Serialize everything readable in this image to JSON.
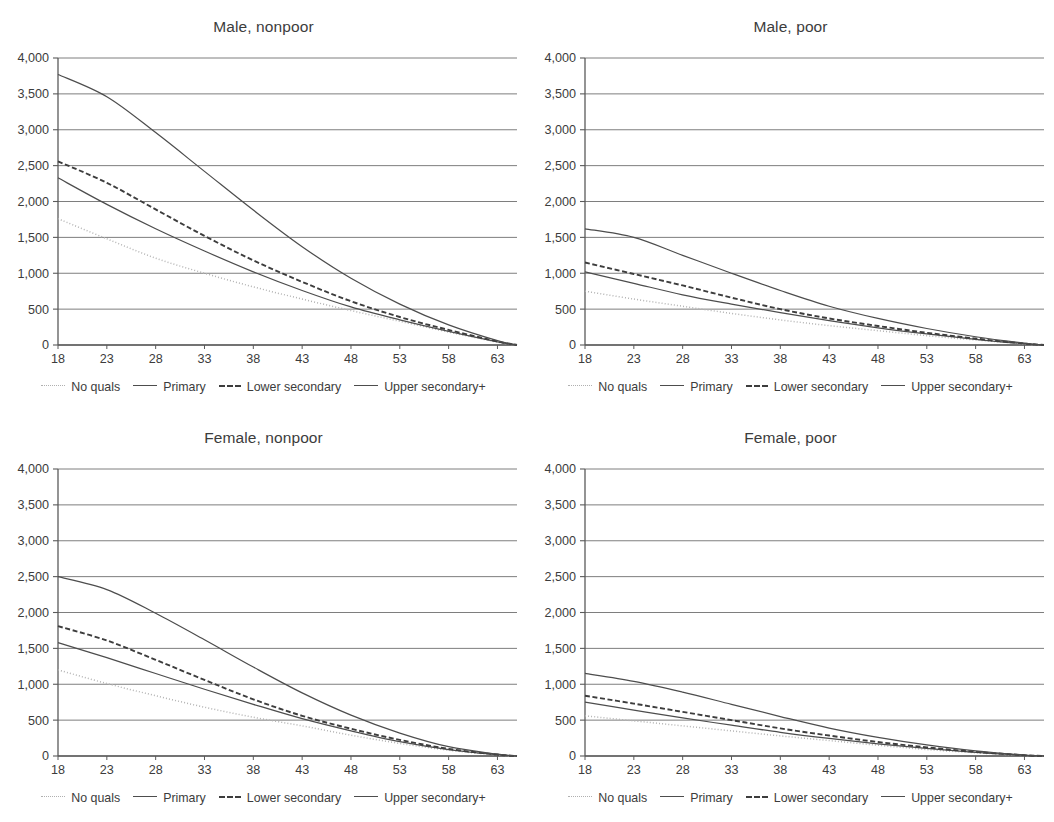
{
  "figure": {
    "panel_count": 4,
    "axis_color": "#5a5a5a",
    "grid_color": "#6b6b6b",
    "text_color": "#3c3c3c"
  },
  "legend": {
    "items": [
      {
        "label": "No quals",
        "style": "dotted",
        "color": "#b0b0b0",
        "icon": "line-dotted-icon"
      },
      {
        "label": "Primary",
        "style": "solid",
        "color": "#4d4d4d",
        "icon": "line-solid-icon"
      },
      {
        "label": "Lower secondary",
        "style": "dashed",
        "color": "#3d3d3d",
        "icon": "line-dashed-icon"
      },
      {
        "label": "Upper secondary+",
        "style": "solid",
        "color": "#4d4d4d",
        "icon": "line-solid-icon"
      }
    ]
  },
  "chart_data": [
    {
      "type": "line",
      "title": "Male, nonpoor",
      "xlabel": "",
      "ylabel": "",
      "xlim": [
        18,
        65
      ],
      "ylim": [
        0,
        4000
      ],
      "xticks": [
        18,
        23,
        28,
        33,
        38,
        43,
        48,
        53,
        58,
        63
      ],
      "yticks": [
        0,
        500,
        1000,
        1500,
        2000,
        2500,
        3000,
        3500,
        4000
      ],
      "ytick_labels": [
        "0",
        "500",
        "1,000",
        "1,500",
        "2,000",
        "2,500",
        "3,000",
        "3,500",
        "4,000"
      ],
      "grid": "horizontal",
      "legend_position": "below",
      "x": [
        18,
        23,
        28,
        33,
        38,
        43,
        48,
        53,
        58,
        63,
        65
      ],
      "series": [
        {
          "name": "No quals",
          "style": "dotted",
          "values": [
            1760,
            1480,
            1210,
            1000,
            810,
            640,
            480,
            330,
            180,
            40,
            0
          ]
        },
        {
          "name": "Primary",
          "style": "solid",
          "values": [
            2330,
            1960,
            1620,
            1310,
            1020,
            760,
            530,
            350,
            190,
            45,
            0
          ]
        },
        {
          "name": "Lower secondary",
          "style": "dashed",
          "values": [
            2560,
            2260,
            1890,
            1520,
            1180,
            880,
            610,
            390,
            210,
            50,
            0
          ]
        },
        {
          "name": "Upper secondary+",
          "style": "solid",
          "values": [
            3770,
            3460,
            2960,
            2420,
            1880,
            1370,
            930,
            570,
            280,
            60,
            0
          ]
        }
      ]
    },
    {
      "type": "line",
      "title": "Male, poor",
      "xlabel": "",
      "ylabel": "",
      "xlim": [
        18,
        65
      ],
      "ylim": [
        0,
        4000
      ],
      "xticks": [
        18,
        23,
        28,
        33,
        38,
        43,
        48,
        53,
        58,
        63
      ],
      "yticks": [
        0,
        500,
        1000,
        1500,
        2000,
        2500,
        3000,
        3500,
        4000
      ],
      "ytick_labels": [
        "0",
        "500",
        "1,000",
        "1,500",
        "2,000",
        "2,500",
        "3,000",
        "3,500",
        "4,000"
      ],
      "grid": "horizontal",
      "legend_position": "below",
      "x": [
        18,
        23,
        28,
        33,
        38,
        43,
        48,
        53,
        58,
        63,
        65
      ],
      "series": [
        {
          "name": "No quals",
          "style": "dotted",
          "values": [
            750,
            640,
            540,
            440,
            350,
            270,
            200,
            130,
            70,
            15,
            0
          ]
        },
        {
          "name": "Primary",
          "style": "solid",
          "values": [
            1020,
            860,
            700,
            570,
            450,
            340,
            240,
            155,
            80,
            18,
            0
          ]
        },
        {
          "name": "Lower secondary",
          "style": "dashed",
          "values": [
            1150,
            990,
            830,
            660,
            500,
            370,
            265,
            170,
            90,
            20,
            0
          ]
        },
        {
          "name": "Upper secondary+",
          "style": "solid",
          "values": [
            1620,
            1500,
            1250,
            1000,
            760,
            540,
            370,
            230,
            115,
            25,
            0
          ]
        }
      ]
    },
    {
      "type": "line",
      "title": "Female, nonpoor",
      "xlabel": "",
      "ylabel": "",
      "xlim": [
        18,
        65
      ],
      "ylim": [
        0,
        4000
      ],
      "xticks": [
        18,
        23,
        28,
        33,
        38,
        43,
        48,
        53,
        58,
        63
      ],
      "yticks": [
        0,
        500,
        1000,
        1500,
        2000,
        2500,
        3000,
        3500,
        4000
      ],
      "ytick_labels": [
        "0",
        "500",
        "1,000",
        "1,500",
        "2,000",
        "2,500",
        "3,000",
        "3,500",
        "4,000"
      ],
      "grid": "horizontal",
      "legend_position": "below",
      "x": [
        18,
        23,
        28,
        33,
        38,
        43,
        48,
        53,
        58,
        63,
        65
      ],
      "series": [
        {
          "name": "No quals",
          "style": "dotted",
          "values": [
            1200,
            1010,
            840,
            680,
            540,
            420,
            290,
            175,
            80,
            15,
            0
          ]
        },
        {
          "name": "Primary",
          "style": "solid",
          "values": [
            1580,
            1370,
            1150,
            930,
            720,
            520,
            350,
            200,
            90,
            18,
            0
          ]
        },
        {
          "name": "Lower secondary",
          "style": "dashed",
          "values": [
            1810,
            1610,
            1340,
            1060,
            790,
            560,
            380,
            225,
            100,
            20,
            0
          ]
        },
        {
          "name": "Upper secondary+",
          "style": "solid",
          "values": [
            2500,
            2320,
            1990,
            1620,
            1240,
            880,
            570,
            320,
            130,
            25,
            0
          ]
        }
      ]
    },
    {
      "type": "line",
      "title": "Female, poor",
      "xlabel": "",
      "ylabel": "",
      "xlim": [
        18,
        65
      ],
      "ylim": [
        0,
        4000
      ],
      "xticks": [
        18,
        23,
        28,
        33,
        38,
        43,
        48,
        53,
        58,
        63
      ],
      "yticks": [
        0,
        500,
        1000,
        1500,
        2000,
        2500,
        3000,
        3500,
        4000
      ],
      "ytick_labels": [
        "0",
        "500",
        "1,000",
        "1,500",
        "2,000",
        "2,500",
        "3,000",
        "3,500",
        "4,000"
      ],
      "grid": "horizontal",
      "legend_position": "below",
      "x": [
        18,
        23,
        28,
        33,
        38,
        43,
        48,
        53,
        58,
        63,
        65
      ],
      "series": [
        {
          "name": "No quals",
          "style": "dotted",
          "values": [
            560,
            490,
            420,
            350,
            280,
            215,
            150,
            90,
            45,
            8,
            0
          ]
        },
        {
          "name": "Primary",
          "style": "solid",
          "values": [
            750,
            640,
            530,
            430,
            330,
            245,
            170,
            105,
            50,
            10,
            0
          ]
        },
        {
          "name": "Lower secondary",
          "style": "dashed",
          "values": [
            840,
            730,
            615,
            500,
            385,
            285,
            195,
            120,
            58,
            11,
            0
          ]
        },
        {
          "name": "Upper secondary+",
          "style": "solid",
          "values": [
            1150,
            1040,
            890,
            720,
            550,
            390,
            260,
            155,
            72,
            14,
            0
          ]
        }
      ]
    }
  ]
}
